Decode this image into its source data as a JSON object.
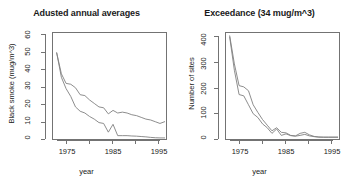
{
  "figure": {
    "width": 346,
    "height": 191,
    "background": "#ffffff",
    "line_color": "#808080",
    "axis_color": "#737373",
    "text_color": "#1a1a1a"
  },
  "panels": [
    {
      "id": "left",
      "title": "Adusted annual averages",
      "ylabel": "Black smoke (mug/m^3)",
      "xlabel": "year"
    },
    {
      "id": "right",
      "title": "Exceedance (34 mug/m^3)",
      "ylabel": "Number of sites",
      "xlabel": "year"
    }
  ],
  "chart_data": [
    {
      "type": "line",
      "title": "Adusted annual averages",
      "xlabel": "year",
      "ylabel": "Black smoke (mug/m^3)",
      "xlim": [
        1972,
        1996.5
      ],
      "ylim": [
        0,
        62
      ],
      "xticks": [
        1975,
        1980,
        1985,
        1990,
        1995
      ],
      "xtick_labels": [
        "1975",
        "",
        "1985",
        "",
        "1995"
      ],
      "yticks": [
        0,
        10,
        20,
        30,
        40,
        50,
        60
      ],
      "ytick_labels": [
        "0",
        "10",
        "20",
        "30",
        "40",
        "50",
        "60"
      ],
      "grid": false,
      "legend": "none",
      "x": [
        1973,
        1974,
        1975,
        1976,
        1977,
        1978,
        1979,
        1980,
        1981,
        1982,
        1983,
        1984,
        1985,
        1986,
        1987,
        1988,
        1989,
        1990,
        1991,
        1992,
        1993,
        1994,
        1995,
        1996
      ],
      "series": [
        {
          "name": "upper curve",
          "values": [
            50.0,
            38.0,
            32.5,
            32.0,
            30.0,
            26.0,
            25.5,
            23.0,
            21.0,
            19.0,
            18.5,
            15.0,
            17.0,
            15.5,
            16.0,
            15.5,
            14.5,
            14.0,
            13.0,
            12.0,
            11.5,
            10.5,
            9.5,
            10.5
          ]
        },
        {
          "name": "lower curve",
          "values": [
            50.0,
            36.0,
            29.5,
            25.0,
            19.0,
            16.5,
            15.5,
            13.5,
            12.0,
            10.0,
            9.5,
            4.5,
            9.0,
            2.5,
            2.5,
            2.5,
            2.3,
            2.2,
            2.0,
            1.8,
            1.5,
            1.3,
            1.2,
            1.2
          ]
        }
      ]
    },
    {
      "type": "line",
      "title": "Exceedance (34 mug/m^3)",
      "xlabel": "year",
      "ylabel": "Number of sites",
      "xlim": [
        1972,
        1996.5
      ],
      "ylim": [
        -8,
        415
      ],
      "xticks": [
        1975,
        1980,
        1985,
        1990,
        1995
      ],
      "xtick_labels": [
        "1975",
        "",
        "1985",
        "",
        "1995"
      ],
      "yticks": [
        0,
        100,
        200,
        300,
        400
      ],
      "ytick_labels": [
        "0",
        "100",
        "200",
        "300",
        "400"
      ],
      "grid": false,
      "legend": "none",
      "x": [
        1973,
        1974,
        1975,
        1976,
        1977,
        1978,
        1979,
        1980,
        1981,
        1982,
        1983,
        1984,
        1985,
        1986,
        1987,
        1988,
        1989,
        1990,
        1991,
        1992,
        1993,
        1994,
        1995,
        1996
      ],
      "series": [
        {
          "name": "upper curve",
          "values": [
            400,
            290,
            205,
            200,
            185,
            130,
            100,
            72,
            50,
            28,
            40,
            22,
            20,
            10,
            8,
            18,
            22,
            12,
            6,
            4,
            3,
            3,
            3,
            3
          ]
        },
        {
          "name": "lower curve",
          "values": [
            395,
            265,
            170,
            165,
            130,
            95,
            80,
            55,
            40,
            18,
            35,
            10,
            16,
            9,
            7,
            10,
            14,
            8,
            5,
            3,
            3,
            3,
            3,
            3
          ]
        }
      ]
    }
  ]
}
